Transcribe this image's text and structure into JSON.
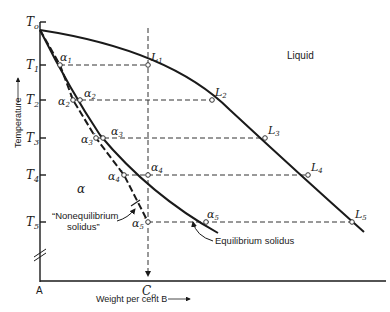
{
  "diagram": {
    "type": "binary phase diagram (solid solution, nonequilibrium cooling)",
    "axes": {
      "y_label": "Temperature",
      "x_label": "Weight per cent B",
      "origin_label": "A",
      "composition_label": "C",
      "composition_sub": "o",
      "temperature_ticks": [
        {
          "main": "T",
          "sub": "o"
        },
        {
          "main": "T",
          "sub": "1"
        },
        {
          "main": "T",
          "sub": "2"
        },
        {
          "main": "T",
          "sub": "3"
        },
        {
          "main": "T",
          "sub": "4"
        },
        {
          "main": "T",
          "sub": "5"
        }
      ]
    },
    "regions": {
      "liquid": "Liquid",
      "alpha": "α"
    },
    "annotations": {
      "nonequilibrium_line1": "“Nonequilibrium",
      "nonequilibrium_line2": "solidus”",
      "equilibrium": "Equilibrium solidus"
    },
    "liquidus_points": [
      {
        "main": "L",
        "sub": "1"
      },
      {
        "main": "L",
        "sub": "2"
      },
      {
        "main": "L",
        "sub": "3"
      },
      {
        "main": "L",
        "sub": "4"
      },
      {
        "main": "L",
        "sub": "5"
      }
    ],
    "solidus_points": [
      {
        "main": "α",
        "sub": "1"
      },
      {
        "main": "α",
        "sub": "2"
      },
      {
        "main": "α",
        "sub": "3"
      },
      {
        "main": "α",
        "sub": "4"
      },
      {
        "main": "α",
        "sub": "5"
      }
    ],
    "nonequilibrium_points": [
      {
        "main": "α",
        "sub": "2",
        "prime": "′"
      },
      {
        "main": "α",
        "sub": "3",
        "prime": "′"
      },
      {
        "main": "α",
        "sub": "4",
        "prime": "′"
      },
      {
        "main": "α",
        "sub": "5",
        "prime": "′"
      }
    ],
    "arrow": "→"
  }
}
